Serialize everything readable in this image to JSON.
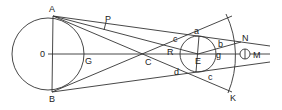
{
  "diagram": {
    "title": "",
    "stroke_color": "#333333",
    "background": "#ffffff",
    "labels": {
      "A": "A",
      "B": "B",
      "O": "0",
      "G": "G",
      "P": "P",
      "C": "C",
      "R": "R",
      "E": "E",
      "a": "a",
      "b": "b",
      "c_upper": "c",
      "c_lower": "c",
      "d": "d",
      "g": "g",
      "N": "N",
      "M": "M",
      "K": "K"
    },
    "shapes": {
      "large_circle": {
        "cx": 48,
        "cy": 54,
        "r": 36
      },
      "small_circle": {
        "cx": 198,
        "cy": 54,
        "r": 18
      },
      "marker_circle": {
        "cx": 245,
        "cy": 54,
        "r": 5
      },
      "arc": {
        "cx": 148,
        "cy": 54,
        "r": 97
      }
    }
  }
}
